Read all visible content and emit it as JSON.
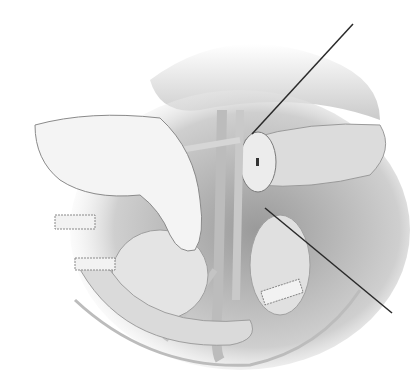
{
  "image": {
    "type": "surgical-illustration",
    "style": "grayscale pencil rendering",
    "width": 413,
    "height": 392,
    "colors": {
      "background": "#ffffff",
      "tissue_light": "#e6e6e6",
      "tissue_mid": "#c8c8c8",
      "tissue_dark": "#8c8c8c",
      "shadow": "#6e6e6e",
      "needle": "#2a2a2a"
    },
    "elements": [
      {
        "name": "gloved-hand",
        "region": "left"
      },
      {
        "name": "pancreas-tail",
        "region": "upper-right"
      },
      {
        "name": "transected-stump",
        "region": "center"
      },
      {
        "name": "retraction-needle",
        "region": "diagonal-right"
      },
      {
        "name": "bowel-loops",
        "region": "lower-left"
      },
      {
        "name": "vessels",
        "region": "center"
      },
      {
        "name": "gauze-packs",
        "region": "edges"
      },
      {
        "name": "peritoneal-margin",
        "region": "bottom"
      }
    ]
  }
}
